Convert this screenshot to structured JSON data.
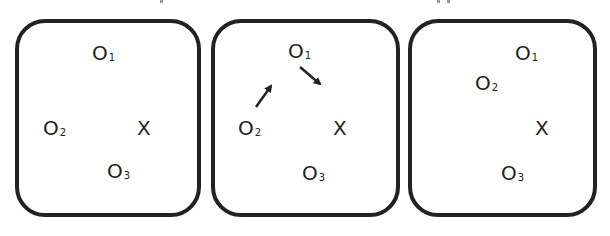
{
  "diagram": {
    "stroke_color": "#222222",
    "panels": [
      {
        "id": "panel-1",
        "labels": [
          {
            "name": "O",
            "sub": "1",
            "x": 92,
            "y": 43
          },
          {
            "name": "O",
            "sub": "2",
            "x": 43,
            "y": 118
          },
          {
            "name": "X",
            "sub": "",
            "x": 137,
            "y": 118
          },
          {
            "name": "O",
            "sub": "3",
            "x": 107,
            "y": 161
          }
        ]
      },
      {
        "id": "panel-2",
        "labels": [
          {
            "name": "O",
            "sub": "1",
            "x": 288,
            "y": 41
          },
          {
            "name": "O",
            "sub": "2",
            "x": 238,
            "y": 118
          },
          {
            "name": "X",
            "sub": "",
            "x": 333,
            "y": 118
          },
          {
            "name": "O",
            "sub": "3",
            "x": 302,
            "y": 163
          }
        ],
        "arrows": [
          {
            "from": [
              256,
              107
            ],
            "to": [
              272,
              84
            ],
            "meaning": "O2 moving up-right toward O1"
          },
          {
            "from": [
              300,
              67
            ],
            "to": [
              322,
              86
            ],
            "meaning": "O1 moving down-right toward X"
          }
        ]
      },
      {
        "id": "panel-3",
        "labels": [
          {
            "name": "O",
            "sub": "1",
            "x": 515,
            "y": 43
          },
          {
            "name": "O",
            "sub": "2",
            "x": 475,
            "y": 73
          },
          {
            "name": "X",
            "sub": "",
            "x": 535,
            "y": 118
          },
          {
            "name": "O",
            "sub": "3",
            "x": 501,
            "y": 163
          }
        ]
      }
    ]
  }
}
